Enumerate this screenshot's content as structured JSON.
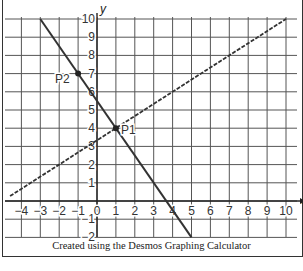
{
  "chart_data": {
    "type": "line",
    "title": "",
    "xlabel": "x",
    "ylabel": "y",
    "xlim": [
      -4.5,
      10.3
    ],
    "ylim": [
      -2,
      10.2
    ],
    "grid": true,
    "x_ticks": [
      -4,
      -3,
      -2,
      -1,
      0,
      1,
      2,
      3,
      4,
      5,
      6,
      7,
      8,
      9,
      10
    ],
    "y_ticks": [
      -2,
      -1,
      1,
      2,
      3,
      4,
      5,
      6,
      7,
      8,
      9,
      10
    ],
    "x_tick_labels": [
      "−4",
      "−3",
      "−2",
      "−1",
      "0",
      "1",
      "2",
      "3",
      "4",
      "5",
      "6",
      "7",
      "8",
      "9",
      "10"
    ],
    "y_tick_labels": [
      "−2",
      "−1",
      "1",
      "2",
      "3",
      "4",
      "5",
      "6",
      "7",
      "8",
      "9",
      "10"
    ],
    "series": [
      {
        "name": "solid line",
        "style": "solid",
        "equation": "y = -1.5x + 5.5",
        "x": [
          -3,
          5
        ],
        "y": [
          10,
          -2
        ]
      },
      {
        "name": "dashed line",
        "style": "dashed",
        "equation": "y = (2/3)x + 10/3",
        "x": [
          -4.6,
          10
        ],
        "y": [
          0.27,
          10
        ]
      }
    ],
    "points": [
      {
        "label": "P1",
        "x": 1,
        "y": 4
      },
      {
        "label": "P2",
        "x": -1,
        "y": 7
      }
    ],
    "caption": "Created using the Desmos Graphing Calculator"
  },
  "colors": {
    "grid": "#555555",
    "line": "#333333",
    "background": "#ffffff"
  }
}
